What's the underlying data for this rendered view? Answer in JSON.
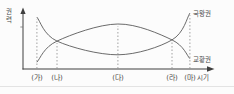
{
  "figure": {
    "description_visible_text_only": "",
    "ylabel": "권력",
    "xlabel": "시기"
  },
  "chart_data": {
    "type": "line",
    "title": "",
    "ylabel": "권력",
    "xlabel": "시기",
    "categories": [
      "(가)",
      "(나)",
      "(다)",
      "(라)",
      "(마)"
    ],
    "series": [
      {
        "name": "국왕권",
        "values": [
          0.91,
          0.49,
          0.25,
          0.51,
          0.98
        ]
      },
      {
        "name": "교황권",
        "values": [
          0.12,
          0.49,
          0.79,
          0.51,
          0.18
        ]
      }
    ],
    "ylim": [
      0,
      1
    ],
    "grid": "dashed vertical guide at each category up to upper curve",
    "legend_position": "labels at right end of each curve",
    "layout": {
      "category_positions": [
        0.073,
        0.178,
        0.497,
        0.78,
        0.874
      ],
      "curve_color": "#5a5a5a",
      "axis_color": "#3f3f3f",
      "guide_color": "#8a8a8a",
      "text_color": "#4a4a4a"
    }
  }
}
